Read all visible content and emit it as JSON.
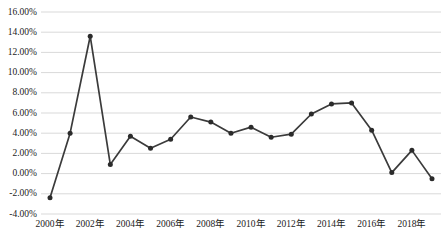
{
  "chart_data": {
    "type": "line",
    "title": "",
    "xlabel": "",
    "ylabel": "",
    "grid": true,
    "legend": false,
    "ylim": [
      -4,
      16
    ],
    "ytick_labels": [
      "16.00%",
      "14.00%",
      "12.00%",
      "10.00%",
      "8.00%",
      "6.00%",
      "4.00%",
      "2.00%",
      "0.00%",
      "-2.00%",
      "-4.00%"
    ],
    "ytick_values": [
      16,
      14,
      12,
      10,
      8,
      6,
      4,
      2,
      0,
      -2,
      -4
    ],
    "xtick_labels": [
      "2000年",
      "2002年",
      "2004年",
      "2006年",
      "2008年",
      "2010年",
      "2012年",
      "2014年",
      "2016年",
      "2018年"
    ],
    "xtick_values": [
      2000,
      2002,
      2004,
      2006,
      2008,
      2010,
      2012,
      2014,
      2016,
      2018
    ],
    "x": [
      2000,
      2001,
      2002,
      2003,
      2004,
      2005,
      2006,
      2007,
      2008,
      2009,
      2010,
      2011,
      2012,
      2013,
      2014,
      2015,
      2016,
      2017,
      2018,
      2019
    ],
    "values": [
      -2.4,
      4.0,
      13.6,
      0.9,
      3.7,
      2.5,
      3.4,
      5.6,
      5.1,
      4.0,
      4.6,
      3.6,
      3.9,
      5.9,
      6.9,
      7.0,
      4.3,
      0.1,
      2.3,
      -0.5
    ],
    "series_name": "",
    "line_color": "#3b3b3b",
    "marker_color": "#2b2b2b",
    "grid_color": "#d9d9d9"
  }
}
